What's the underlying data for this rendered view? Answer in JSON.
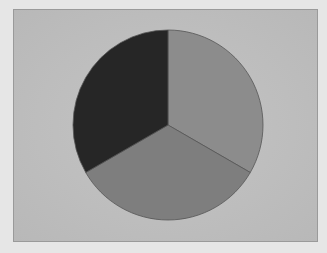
{
  "chart_data": {
    "type": "pie",
    "title": "",
    "categories": [
      "Slice 1",
      "Slice 2",
      "Slice 3"
    ],
    "values": [
      33.3,
      33.3,
      33.3
    ],
    "colors": [
      "#8c8c8c",
      "#7e7e7e",
      "#262626"
    ],
    "start_angle_deg": 0,
    "direction": "clockwise",
    "legend": null,
    "labels_shown": false
  },
  "layout": {
    "panel_bg": "#bfbfbf",
    "page_bg": "#e6e6e6",
    "center": [
      168,
      125
    ],
    "radius": 95
  }
}
